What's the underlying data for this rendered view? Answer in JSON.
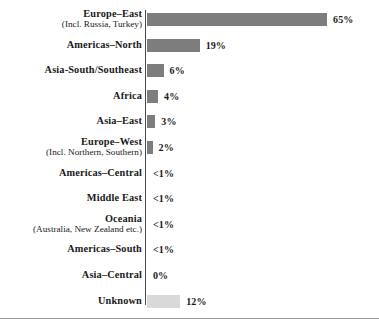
{
  "chart_data": {
    "type": "bar",
    "title": "",
    "subtitle": "",
    "xlabel": "",
    "ylabel": "",
    "orientation": "horizontal",
    "grid": false,
    "legend": false,
    "axis_line": true,
    "xlim": [
      0,
      65
    ],
    "value_suffix": "%",
    "colors": {
      "bar": "#7d7d7d",
      "bar_alt": "#d9d9d9",
      "axis": "#4a4a4a",
      "rule": "#9a9a9a",
      "text": "#1a1a1a",
      "background": "#ffffff"
    },
    "categories": [
      "Europe–East",
      "Americas–North",
      "Asia-South/Southeast",
      "Africa",
      "Asia–East",
      "Europe–West",
      "Americas–Central",
      "Middle East",
      "Oceania",
      "Americas–South",
      "Asia–Central",
      "Unknown"
    ],
    "values": [
      65,
      19,
      6,
      4,
      3,
      2,
      0.5,
      0.5,
      0.5,
      0.5,
      0,
      12
    ],
    "value_labels": [
      "65%",
      "19%",
      "6%",
      "4%",
      "3%",
      "2%",
      "<1%",
      "<1%",
      "<1%",
      "<1%",
      "0%",
      "12%"
    ],
    "rows": [
      {
        "label": "Europe–East",
        "sublabel": "(Incl. Russia, Turkey)",
        "value": 65,
        "value_label": "65%",
        "style": "dark"
      },
      {
        "label": "Americas–North",
        "sublabel": "",
        "value": 19,
        "value_label": "19%",
        "style": "dark"
      },
      {
        "label": "Asia-South/Southeast",
        "sublabel": "",
        "value": 6,
        "value_label": "6%",
        "style": "dark"
      },
      {
        "label": "Africa",
        "sublabel": "",
        "value": 4,
        "value_label": "4%",
        "style": "dark"
      },
      {
        "label": "Asia–East",
        "sublabel": "",
        "value": 3,
        "value_label": "3%",
        "style": "dark"
      },
      {
        "label": "Europe–West",
        "sublabel": "(Incl. Northern, Southern)",
        "value": 2,
        "value_label": "2%",
        "style": "dark"
      },
      {
        "label": "Americas–Central",
        "sublabel": "",
        "value": 0.5,
        "value_label": "<1%",
        "style": "none"
      },
      {
        "label": "Middle East",
        "sublabel": "",
        "value": 0.5,
        "value_label": "<1%",
        "style": "none"
      },
      {
        "label": "Oceania",
        "sublabel": "(Australia, New Zealand etc.)",
        "value": 0.5,
        "value_label": "<1%",
        "style": "none"
      },
      {
        "label": "Americas–South",
        "sublabel": "",
        "value": 0.5,
        "value_label": "<1%",
        "style": "none"
      },
      {
        "label": "Asia–Central",
        "sublabel": "",
        "value": 0,
        "value_label": "0%",
        "style": "none"
      },
      {
        "label": "Unknown",
        "sublabel": "",
        "value": 12,
        "value_label": "12%",
        "style": "light"
      }
    ]
  }
}
